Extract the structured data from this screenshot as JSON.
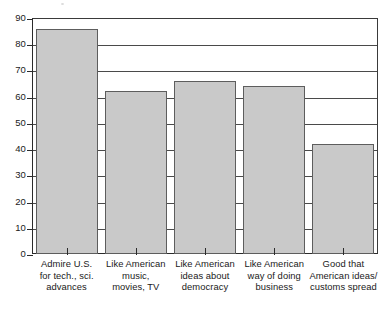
{
  "chart_data": {
    "type": "bar",
    "title": "",
    "subtitle": "",
    "xlabel": "",
    "ylabel": "",
    "categories": [
      "Admire U.S. for tech., sci. advances",
      "Like American music, movies, TV",
      "Like American ideas about democracy",
      "Like American way of doing business",
      "Good that American ideas/ customs spread"
    ],
    "category_lines": [
      [
        "Admire U.S.",
        "for tech., sci.",
        "advances"
      ],
      [
        "Like American",
        "music,",
        "movies, TV"
      ],
      [
        "Like American",
        "ideas about",
        "democracy"
      ],
      [
        "Like American",
        "way of doing",
        "business"
      ],
      [
        "Good that",
        "American ideas/",
        "customs spread"
      ]
    ],
    "values": [
      86,
      62,
      66,
      64,
      42
    ],
    "ylim": [
      0,
      90
    ],
    "ytick_values": [
      0,
      10,
      20,
      30,
      40,
      50,
      60,
      70,
      80,
      90
    ],
    "ytick_labels": [
      "0",
      "10",
      "20",
      "30",
      "40",
      "50",
      "60",
      "70",
      "80",
      "90"
    ],
    "grid": true,
    "grid_axis": "y",
    "legend": false,
    "legend_position": "none",
    "bar_fill_color": "#c9c9c9",
    "bar_edge_color": "#5d5d5d",
    "axis_color": "#2b2b2b",
    "background_color": "#ffffff"
  }
}
